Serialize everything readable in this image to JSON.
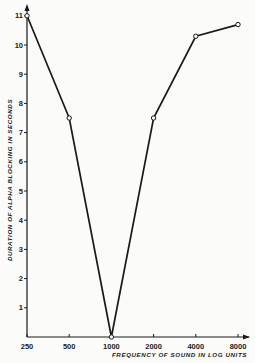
{
  "chart_data": {
    "type": "line",
    "title": "",
    "xlabel": "FREQUENCY OF SOUND IN LOG UNITS",
    "ylabel": "DURATION OF ALPHA BLOCKING IN SECONDS",
    "x_scale": "log",
    "categories": [
      "250",
      "500",
      "1000",
      "2000",
      "4000",
      "8000"
    ],
    "x": [
      250,
      500,
      1000,
      2000,
      4000,
      8000
    ],
    "series": [
      {
        "name": "Alpha blocking duration",
        "values": [
          11,
          7.5,
          0,
          7.5,
          10.3,
          10.7
        ],
        "marker": "open-circle"
      }
    ],
    "y_ticks": [
      "1",
      "2",
      "3",
      "4",
      "5",
      "6",
      "7",
      "8",
      "9",
      "10",
      "11"
    ],
    "ylim": [
      0,
      11.5
    ],
    "grid": false,
    "legend": "none"
  },
  "colors": {
    "line": "#1a1a1a",
    "background": "#fbfbfa"
  }
}
